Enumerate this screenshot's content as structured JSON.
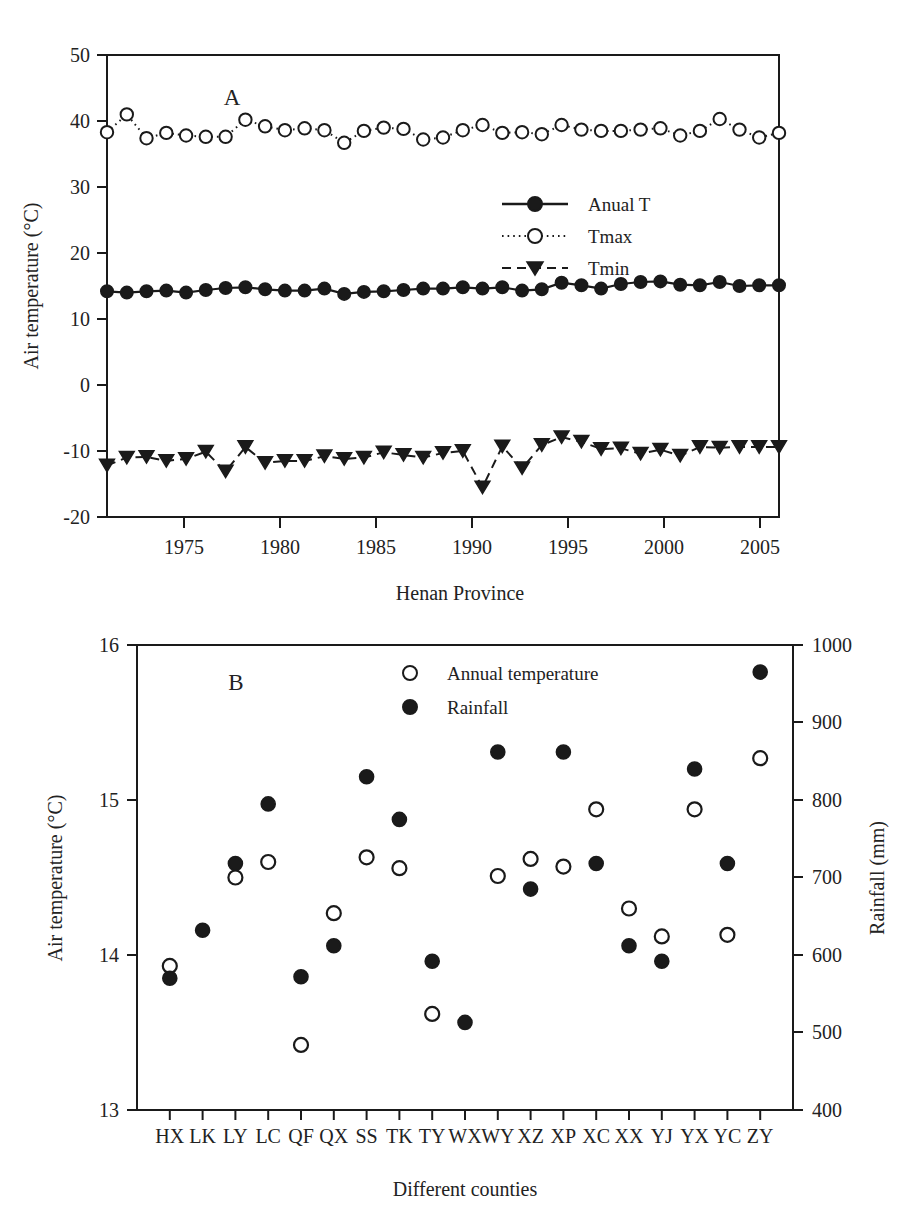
{
  "figure": {
    "width": 920,
    "height": 1229,
    "background": "#ffffff",
    "ink_color": "#1a1a1a"
  },
  "panelA": {
    "label": "A",
    "xlabel": "Henan Province",
    "ylabel": "Air temperature (°C)",
    "yticks": [
      "-20",
      "-10",
      "0",
      "10",
      "20",
      "30",
      "40",
      "50"
    ],
    "xticks": [
      "1975",
      "1980",
      "1985",
      "1990",
      "1995",
      "2000",
      "2005"
    ],
    "legend": [
      {
        "label": "Anual T",
        "marker": "filled-circle",
        "line": "solid"
      },
      {
        "label": "Tmax",
        "marker": "open-circle",
        "line": "dotted"
      },
      {
        "label": "Tmin",
        "marker": "filled-triangle-down",
        "line": "dashed"
      }
    ]
  },
  "panelB": {
    "label": "B",
    "xlabel": "Different counties",
    "ylabel_left": "Air temperature (°C)",
    "ylabel_right": "Rainfall (mm)",
    "yticks_left": [
      "13",
      "14",
      "15",
      "16"
    ],
    "yticks_right": [
      "400",
      "500",
      "600",
      "700",
      "800",
      "900",
      "1000"
    ],
    "legend": [
      {
        "label": "Annual temperature",
        "marker": "open-circle"
      },
      {
        "label": "Rainfall",
        "marker": "filled-circle"
      }
    ]
  },
  "chart_data": [
    {
      "type": "line",
      "panel": "A",
      "title": "",
      "xlabel": "Henan Province",
      "ylabel": "Air temperature (°C)",
      "xlim": [
        1971,
        2005
      ],
      "ylim": [
        -20,
        50
      ],
      "xticks": [
        1975,
        1980,
        1985,
        1990,
        1995,
        2000,
        2005
      ],
      "yticks": [
        -20,
        -10,
        0,
        10,
        20,
        30,
        40,
        50
      ],
      "grid": false,
      "legend_position": "center-right",
      "x": [
        1971,
        1972,
        1973,
        1974,
        1975,
        1976,
        1977,
        1978,
        1979,
        1980,
        1981,
        1982,
        1983,
        1984,
        1985,
        1986,
        1987,
        1988,
        1989,
        1990,
        1991,
        1992,
        1993,
        1994,
        1995,
        1996,
        1997,
        1998,
        1999,
        2000,
        2001,
        2002,
        2003,
        2004,
        2005
      ],
      "series": [
        {
          "name": "Anual T",
          "marker": "filled-circle",
          "line": "solid",
          "values": [
            14.2,
            14.0,
            14.2,
            14.3,
            14.0,
            14.4,
            14.7,
            14.8,
            14.5,
            14.3,
            14.3,
            14.6,
            13.8,
            14.1,
            14.2,
            14.4,
            14.6,
            14.6,
            14.8,
            14.6,
            14.8,
            14.3,
            14.5,
            15.5,
            15.1,
            14.6,
            15.3,
            15.6,
            15.7,
            15.2,
            15.1,
            15.6,
            15.0,
            15.1,
            15.1
          ]
        },
        {
          "name": "Tmax",
          "marker": "open-circle",
          "line": "dotted",
          "values": [
            38.3,
            41.0,
            37.4,
            38.2,
            37.8,
            37.6,
            37.6,
            40.2,
            39.2,
            38.6,
            38.9,
            38.6,
            36.7,
            38.5,
            39.0,
            38.8,
            37.2,
            37.5,
            38.6,
            39.4,
            38.2,
            38.3,
            38.0,
            39.4,
            38.7,
            38.5,
            38.5,
            38.7,
            38.9,
            37.8,
            38.5,
            40.3,
            38.7,
            37.5,
            38.2
          ]
        },
        {
          "name": "Tmin",
          "marker": "filled-triangle-down",
          "line": "dashed",
          "values": [
            -12.2,
            -11.0,
            -10.9,
            -11.5,
            -11.2,
            -10.1,
            -13.1,
            -9.4,
            -11.8,
            -11.5,
            -11.5,
            -10.8,
            -11.2,
            -11.0,
            -10.2,
            -10.6,
            -11.0,
            -10.3,
            -10.0,
            -15.5,
            -9.3,
            -12.6,
            -9.1,
            -7.9,
            -8.6,
            -9.7,
            -9.6,
            -10.4,
            -9.8,
            -10.7,
            -9.4,
            -9.5,
            -9.4,
            -9.4,
            -9.4
          ]
        }
      ]
    },
    {
      "type": "scatter",
      "panel": "B",
      "title": "",
      "xlabel": "Different counties",
      "ylabel_left": "Air temperature (°C)",
      "ylabel_right": "Rainfall (mm)",
      "ylim_left": [
        13,
        16
      ],
      "ylim_right": [
        400,
        1000
      ],
      "yticks_left": [
        13,
        14,
        15,
        16
      ],
      "yticks_right": [
        400,
        500,
        600,
        700,
        800,
        900,
        1000
      ],
      "grid": false,
      "legend_position": "top-center",
      "categories": [
        "HX",
        "LK",
        "LY",
        "LC",
        "QF",
        "QX",
        "SS",
        "TK",
        "TY",
        "WX",
        "WY",
        "XZ",
        "XP",
        "XC",
        "XX",
        "YJ",
        "YX",
        "YC",
        "ZY"
      ],
      "series": [
        {
          "name": "Annual temperature",
          "marker": "open-circle",
          "axis": "left",
          "values": [
            13.93,
            null,
            14.5,
            14.6,
            13.42,
            14.27,
            14.63,
            14.56,
            13.62,
            null,
            14.51,
            14.62,
            14.57,
            14.94,
            14.3,
            14.12,
            14.94,
            14.13,
            15.27
          ]
        },
        {
          "name": "Rainfall",
          "marker": "filled-circle",
          "axis": "right",
          "values": [
            570,
            632,
            718,
            795,
            572,
            612,
            830,
            775,
            592,
            513,
            862,
            685,
            862,
            718,
            612,
            592,
            840,
            718,
            965
          ]
        }
      ]
    }
  ]
}
